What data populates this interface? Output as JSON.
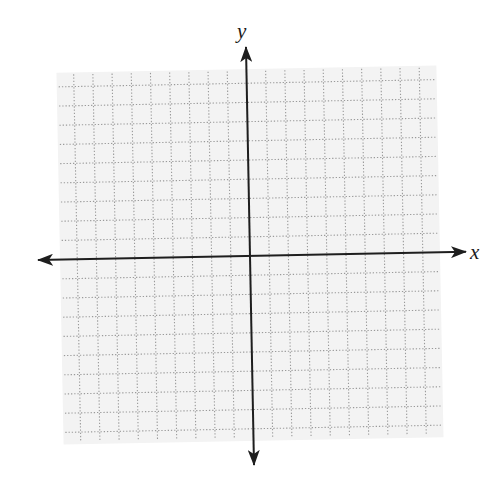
{
  "diagram": {
    "type": "coordinate-plane",
    "axes": {
      "x": {
        "label": "x",
        "arrows": "both"
      },
      "y": {
        "label": "y",
        "arrows": "both"
      }
    },
    "grid": {
      "squares_per_side_of_axis": 10,
      "total_columns": 20,
      "total_rows": 20,
      "tick_labels": [],
      "line_style": "dotted"
    },
    "colors": {
      "background": "#ffffff",
      "grid_fill": "#f3f3f3",
      "grid_line": "#9a9a9a",
      "axis": "#1e1e1e",
      "label": "#1a1a1a"
    }
  }
}
